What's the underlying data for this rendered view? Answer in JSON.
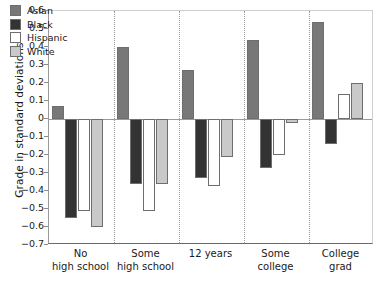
{
  "chart_data": {
    "type": "bar",
    "title": "",
    "xlabel": "",
    "ylabel": "Grade in standard deviations",
    "ylim": [
      -0.7,
      0.6
    ],
    "yticks": [
      0.6,
      0.5,
      0.4,
      0.3,
      0.2,
      0.1,
      0,
      -0.1,
      -0.2,
      -0.3,
      -0.4,
      -0.5,
      -0.6,
      -0.7
    ],
    "ytick_labels": [
      "0.6",
      "0.5",
      "0.4",
      "0.3",
      "0.2",
      "0.1",
      "0",
      "−0.1",
      "−0.2",
      "−0.3",
      "−0.4",
      "−0.5",
      "−0.6",
      "−0.7"
    ],
    "grid": false,
    "legend_position": "top-left",
    "categories": [
      "No high school",
      "Some high school",
      "12 years",
      "Some college",
      "College grad"
    ],
    "category_lines": [
      [
        "No",
        "high school"
      ],
      [
        "Some",
        "high school"
      ],
      [
        "12 years",
        ""
      ],
      [
        "Some",
        "college"
      ],
      [
        "College",
        "grad"
      ]
    ],
    "series": [
      {
        "name": "Asian",
        "color": "#787878",
        "values": [
          0.07,
          0.4,
          0.27,
          0.44,
          0.54
        ]
      },
      {
        "name": "Black",
        "color": "#333333",
        "values": [
          -0.55,
          -0.36,
          -0.33,
          -0.27,
          -0.14
        ]
      },
      {
        "name": "Hispanic",
        "color": "#ffffff",
        "values": [
          -0.51,
          -0.51,
          -0.37,
          -0.2,
          0.14
        ]
      },
      {
        "name": "White",
        "color": "#c9c9c9",
        "values": [
          -0.6,
          -0.36,
          -0.21,
          -0.02,
          0.2
        ]
      }
    ]
  }
}
